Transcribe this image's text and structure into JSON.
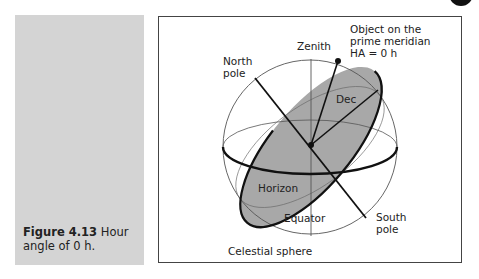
{
  "caption": {
    "figure_number": "Figure 4.13",
    "text": "Hour angle of 0 h."
  },
  "diagram": {
    "title": "Celestial sphere",
    "labels": {
      "zenith": "Zenith",
      "north_pole": "North",
      "north_pole_2": "pole",
      "object_1": "Object on the",
      "object_2": "prime meridian",
      "object_3": "HA = 0 h",
      "dec": "Dec",
      "horizon": "Horizon",
      "equator": "Equator",
      "south_pole": "South",
      "south_pole_2": "pole",
      "celestial_sphere": "Celestial sphere"
    },
    "colors": {
      "horizon_fill": "#a8a8a8",
      "panel_gray": "#d4d4d4",
      "line": "#222222"
    }
  }
}
